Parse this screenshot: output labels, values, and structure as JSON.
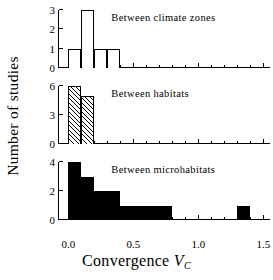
{
  "axes": {
    "ylabel": "Number of studies",
    "xlabel_text": "Convergence",
    "xlabel_symbol": "V",
    "xlabel_subscript": "C",
    "xlim": [
      -0.08,
      1.55
    ],
    "xticks": [
      0.0,
      0.5,
      1.0,
      1.5
    ],
    "xticklabels": [
      "0.0",
      "0.5",
      "1.0",
      "1.5"
    ],
    "xminorticks": [
      0.1,
      0.2,
      0.3,
      0.4,
      0.6,
      0.7,
      0.8,
      0.9,
      1.1,
      1.2,
      1.3,
      1.4
    ]
  },
  "chart_data": {
    "type": "bar",
    "title": "",
    "xlabel": "Convergence VC",
    "ylabel": "Number of studies",
    "xlim": [
      -0.08,
      1.55
    ],
    "grid": false,
    "legend": "none",
    "panels": [
      {
        "id": "climate-zones",
        "caption": "Between climate zones",
        "style": "open",
        "ylim": [
          0,
          3
        ],
        "yticks": [
          0,
          1,
          2,
          3
        ],
        "yticklabels": [
          "0",
          "1",
          "2",
          "3"
        ],
        "bins": [
          {
            "x0": 0.0,
            "x1": 0.1,
            "value": 1
          },
          {
            "x0": 0.1,
            "x1": 0.2,
            "value": 3
          },
          {
            "x0": 0.2,
            "x1": 0.3,
            "value": 1
          },
          {
            "x0": 0.3,
            "x1": 0.4,
            "value": 1
          }
        ]
      },
      {
        "id": "habitats",
        "caption": "Between habitats",
        "style": "hatched",
        "ylim": [
          0,
          6
        ],
        "yticks": [
          0,
          3,
          6
        ],
        "yticklabels": [
          "0",
          "3",
          "6"
        ],
        "bins": [
          {
            "x0": 0.0,
            "x1": 0.1,
            "value": 6
          },
          {
            "x0": 0.1,
            "x1": 0.2,
            "value": 5
          }
        ]
      },
      {
        "id": "microhabitats",
        "caption": "Between microhabitats",
        "style": "solid",
        "ylim": [
          0,
          4
        ],
        "yticks": [
          0,
          2,
          4
        ],
        "yticklabels": [
          "0",
          "2",
          "4"
        ],
        "bins": [
          {
            "x0": 0.0,
            "x1": 0.1,
            "value": 4
          },
          {
            "x0": 0.1,
            "x1": 0.2,
            "value": 3
          },
          {
            "x0": 0.2,
            "x1": 0.4,
            "value": 2
          },
          {
            "x0": 0.4,
            "x1": 0.8,
            "value": 1
          },
          {
            "x0": 1.3,
            "x1": 1.4,
            "value": 1
          }
        ]
      }
    ]
  }
}
